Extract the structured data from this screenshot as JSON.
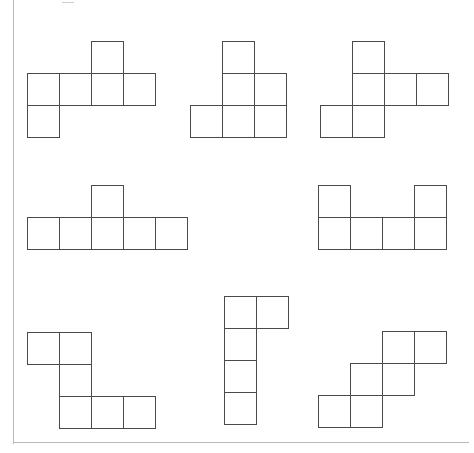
{
  "page": {
    "background_color": "#ffffff",
    "stroke_color": "#4a4a4a",
    "page_edge_color": "#b9b9b9",
    "cell_size_px": 33
  },
  "nets": [
    {
      "id": "net-1",
      "label": "Net 1",
      "origin": {
        "x": 27,
        "y": 41
      },
      "square_count": 6,
      "grid_cells": [
        {
          "row": 0,
          "col": 2
        },
        {
          "row": 1,
          "col": 0
        },
        {
          "row": 1,
          "col": 1
        },
        {
          "row": 1,
          "col": 2
        },
        {
          "row": 1,
          "col": 3
        },
        {
          "row": 2,
          "col": 0
        }
      ]
    },
    {
      "id": "net-2",
      "label": "Net 2",
      "origin": {
        "x": 190,
        "y": 41
      },
      "square_count": 6,
      "grid_cells": [
        {
          "row": 0,
          "col": 1
        },
        {
          "row": 1,
          "col": 1
        },
        {
          "row": 1,
          "col": 2
        },
        {
          "row": 2,
          "col": 0
        },
        {
          "row": 2,
          "col": 1
        },
        {
          "row": 2,
          "col": 2
        }
      ]
    },
    {
      "id": "net-3",
      "label": "Net 3",
      "origin": {
        "x": 320,
        "y": 41
      },
      "square_count": 6,
      "grid_cells": [
        {
          "row": 0,
          "col": 1
        },
        {
          "row": 1,
          "col": 1
        },
        {
          "row": 1,
          "col": 2
        },
        {
          "row": 1,
          "col": 3
        },
        {
          "row": 2,
          "col": 0
        },
        {
          "row": 2,
          "col": 1
        }
      ]
    },
    {
      "id": "net-4",
      "label": "Net 4",
      "origin": {
        "x": 27,
        "y": 185
      },
      "square_count": 6,
      "grid_cells": [
        {
          "row": 0,
          "col": 2
        },
        {
          "row": 1,
          "col": 0
        },
        {
          "row": 1,
          "col": 1
        },
        {
          "row": 1,
          "col": 2
        },
        {
          "row": 1,
          "col": 3
        },
        {
          "row": 1,
          "col": 4
        }
      ]
    },
    {
      "id": "net-5",
      "label": "Net 5",
      "origin": {
        "x": 318,
        "y": 185
      },
      "square_count": 6,
      "grid_cells": [
        {
          "row": 0,
          "col": 0
        },
        {
          "row": 0,
          "col": 3
        },
        {
          "row": 1,
          "col": 0
        },
        {
          "row": 1,
          "col": 1
        },
        {
          "row": 1,
          "col": 2
        },
        {
          "row": 1,
          "col": 3
        }
      ]
    },
    {
      "id": "net-6",
      "label": "Net 6",
      "origin": {
        "x": 27,
        "y": 332
      },
      "square_count": 6,
      "grid_cells": [
        {
          "row": 0,
          "col": 0
        },
        {
          "row": 0,
          "col": 1
        },
        {
          "row": 1,
          "col": 1
        },
        {
          "row": 2,
          "col": 1
        },
        {
          "row": 2,
          "col": 2
        },
        {
          "row": 2,
          "col": 3
        }
      ]
    },
    {
      "id": "net-7",
      "label": "Net 7",
      "origin": {
        "x": 224,
        "y": 296
      },
      "square_count": 5,
      "grid_cells": [
        {
          "row": 0,
          "col": 0
        },
        {
          "row": 0,
          "col": 1
        },
        {
          "row": 1,
          "col": 0
        },
        {
          "row": 2,
          "col": 0
        },
        {
          "row": 3,
          "col": 0
        }
      ]
    },
    {
      "id": "net-8",
      "label": "Net 8",
      "origin": {
        "x": 318,
        "y": 331
      },
      "square_count": 6,
      "grid_cells": [
        {
          "row": 0,
          "col": 2
        },
        {
          "row": 0,
          "col": 3
        },
        {
          "row": 1,
          "col": 1
        },
        {
          "row": 1,
          "col": 2
        },
        {
          "row": 2,
          "col": 0
        },
        {
          "row": 2,
          "col": 1
        }
      ]
    }
  ]
}
